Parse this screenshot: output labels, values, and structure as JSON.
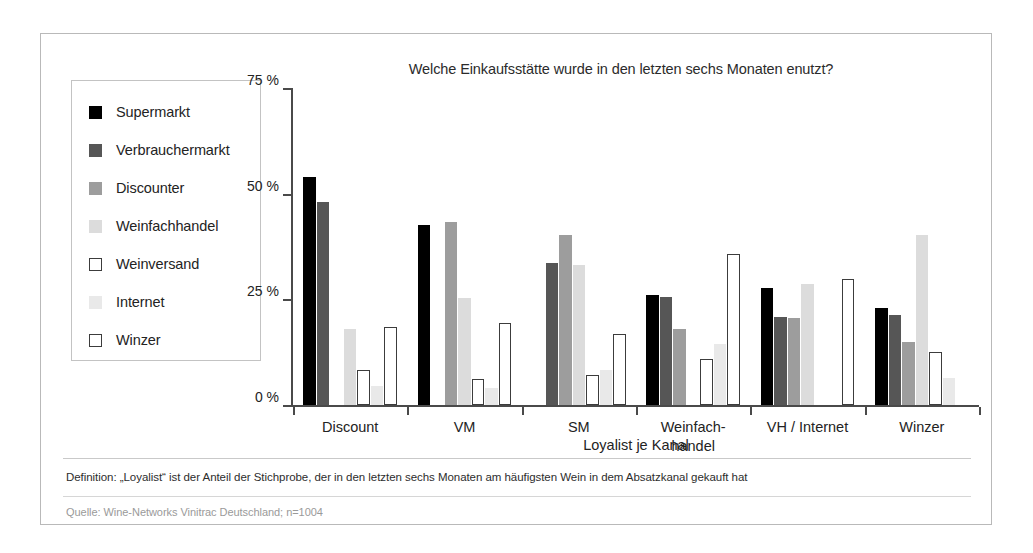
{
  "card": {
    "border_color": "#b9b9b9"
  },
  "chart_data": {
    "type": "bar",
    "title": "Welche Einkaufsstätte wurde in den letzten sechs Monaten enutzt?",
    "xlabel": "Loyalist je Kanal",
    "ylabel": "",
    "ylim": [
      0,
      75
    ],
    "yticks": [
      0,
      25,
      50,
      75
    ],
    "ytick_labels": [
      "0 %",
      "25 %",
      "50 %",
      "75 %"
    ],
    "grid": false,
    "legend_position": "left-outside",
    "categories": [
      "Discount",
      "VM",
      "SM",
      "Weinfach-\nhandel",
      "VH / Internet",
      "Winzer"
    ],
    "category_labels_flat": [
      "Discount",
      "VM",
      "SM",
      "Weinfach-handel",
      "VH / Internet",
      "Winzer"
    ],
    "series": [
      {
        "name": "Supermarkt",
        "color": "#000000",
        "border": "#000000",
        "values": [
          54,
          42.5,
          null,
          26,
          27.8,
          23
        ]
      },
      {
        "name": "Verbrauchermarkt",
        "color": "#565656",
        "border": "#565656",
        "values": [
          48,
          null,
          33.5,
          25.5,
          20.8,
          21.3
        ]
      },
      {
        "name": "Discounter",
        "color": "#9d9d9d",
        "border": "#9d9d9d",
        "values": [
          null,
          43.3,
          40.3,
          18,
          20.7,
          15
        ]
      },
      {
        "name": "Weinfachhandel",
        "color": "#dcdcdc",
        "border": "#dcdcdc",
        "values": [
          18,
          25.3,
          33.2,
          null,
          28.7,
          40.3
        ]
      },
      {
        "name": "Weinversand",
        "color": "#ffffff",
        "border": "#3c3c3c",
        "values": [
          8.2,
          6.2,
          7,
          11,
          null,
          12.5
        ]
      },
      {
        "name": "Internet",
        "color": "#e9e9e9",
        "border": "#e9e9e9",
        "values": [
          4.6,
          4,
          8.2,
          14.5,
          null,
          6.4
        ]
      },
      {
        "name": "Winzer",
        "color": "#ffffff",
        "border": "#3c3c3c",
        "values": [
          18.5,
          19.4,
          16.7,
          35.8,
          29.8,
          null
        ]
      }
    ]
  },
  "notes": {
    "definition": "Definition: „Loyalist“ ist der Anteil der Stichprobe, der in den letzten sechs Monaten am häufigsten Wein in dem Absatzkanal gekauft hat",
    "source": "Quelle: Wine-Networks Vinitrac Deutschland; n=1004"
  }
}
